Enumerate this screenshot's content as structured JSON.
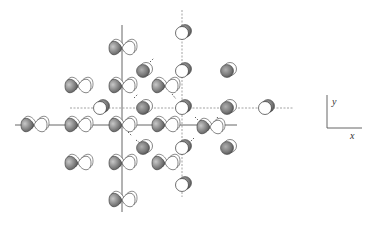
{
  "diagram": {
    "colors": {
      "background": "#ffffff",
      "line": "#555555",
      "dashed_line": "#999999",
      "orbital_dark": "#6e6e6e",
      "orbital_light": "#ffffff",
      "sphere_gray": "#7a7a7a",
      "sphere_white": "#ffffff"
    },
    "lines": {
      "solid_vertical": {
        "x": 122,
        "y1": 25,
        "y2": 212
      },
      "dashed_vertical": {
        "x": 182,
        "y1": 10,
        "y2": 197
      },
      "solid_horizontal": {
        "y": 125,
        "x1": 15,
        "x2": 237
      },
      "dashed_horizontal": {
        "y": 108,
        "x1": 70,
        "x2": 293
      }
    },
    "orbitals": [
      {
        "x": 122,
        "y": 48
      },
      {
        "x": 78,
        "y": 86
      },
      {
        "x": 122,
        "y": 86
      },
      {
        "x": 165,
        "y": 86
      },
      {
        "x": 34,
        "y": 125
      },
      {
        "x": 78,
        "y": 125
      },
      {
        "x": 122,
        "y": 125
      },
      {
        "x": 165,
        "y": 125
      },
      {
        "x": 210,
        "y": 127
      },
      {
        "x": 78,
        "y": 163
      },
      {
        "x": 122,
        "y": 163
      },
      {
        "x": 165,
        "y": 163
      },
      {
        "x": 122,
        "y": 200
      }
    ],
    "spheres": [
      {
        "x": 182,
        "y": 33,
        "type": "white"
      },
      {
        "x": 182,
        "y": 71,
        "type": "white"
      },
      {
        "x": 182,
        "y": 108,
        "type": "white"
      },
      {
        "x": 182,
        "y": 148,
        "type": "white"
      },
      {
        "x": 182,
        "y": 185,
        "type": "white"
      },
      {
        "x": 100,
        "y": 108,
        "type": "white"
      },
      {
        "x": 265,
        "y": 108,
        "type": "white"
      },
      {
        "x": 143,
        "y": 71,
        "type": "gray"
      },
      {
        "x": 143,
        "y": 108,
        "type": "gray"
      },
      {
        "x": 227,
        "y": 71,
        "type": "gray"
      },
      {
        "x": 227,
        "y": 108,
        "type": "gray"
      },
      {
        "x": 143,
        "y": 148,
        "type": "gray"
      },
      {
        "x": 227,
        "y": 148,
        "type": "gray"
      }
    ],
    "axes_indicator": {
      "y_label": "y",
      "x_label": "x"
    }
  }
}
